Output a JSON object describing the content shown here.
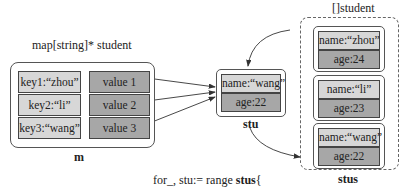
{
  "map": {
    "type_label": "map[string]* student",
    "name": "m",
    "entries": [
      {
        "key": "key1:“zhou”",
        "value": "value 1"
      },
      {
        "key": "key2:“li”",
        "value": "value 2"
      },
      {
        "key": "key3:“wang”",
        "value": "value 3"
      }
    ]
  },
  "stu": {
    "name": "stu",
    "fields": {
      "name": "name:“wang”",
      "age": "age:22"
    }
  },
  "slice": {
    "type_label": "[]student",
    "name": "stus",
    "items": [
      {
        "name": "name:“zhou”",
        "age": "age:24"
      },
      {
        "name": "name:“li”",
        "age": "age:23"
      },
      {
        "name": "name:“wang”",
        "age": "age:22"
      }
    ]
  },
  "code": {
    "line1_a": "for_, stu:= range ",
    "line1_b": "stus",
    "line1_c": "{",
    "line2_a": "m[stu.Name]",
    "line2_b": " = &stu",
    "line3": "}"
  },
  "colors": {
    "key_fill": "#d7d7d7",
    "value_fill": "#a7a7a7",
    "stroke": "#444444"
  }
}
